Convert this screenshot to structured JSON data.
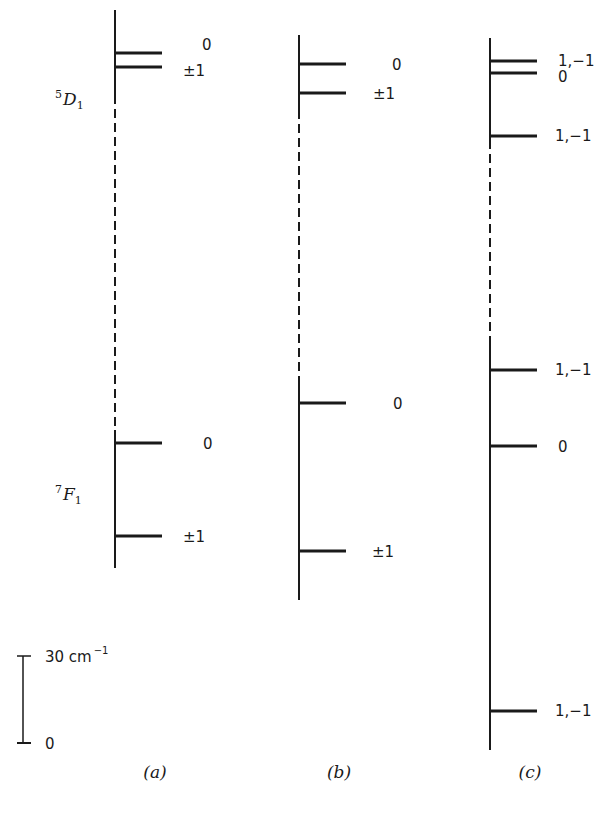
{
  "figure": {
    "type": "energy-level-diagram",
    "panels": [
      {
        "id": "a",
        "caption": "(a)",
        "axis_x": 115,
        "axis_top": 10,
        "axis_bottom": 568,
        "dashed_from": 95,
        "dashed_to": 430,
        "upper_term": {
          "symbol": "D",
          "left_sup": "5",
          "sub": "1",
          "label_x": 55,
          "label_y": 105
        },
        "lower_term": {
          "symbol": "F",
          "left_sup": "7",
          "sub": "1",
          "label_x": 55,
          "label_y": 500
        },
        "levels": [
          {
            "y": 53,
            "label": "0",
            "label_x": 202,
            "label_y": 50
          },
          {
            "y": 67,
            "label": "±1",
            "label_x": 183,
            "label_y": 76
          },
          {
            "y": 443,
            "label": "0",
            "label_x": 203,
            "label_y": 449
          },
          {
            "y": 536,
            "label": "±1",
            "label_x": 183,
            "label_y": 542
          }
        ]
      },
      {
        "id": "b",
        "caption": "(b)",
        "axis_x": 299,
        "axis_top": 35,
        "axis_bottom": 600,
        "dashed_from": 110,
        "dashed_to": 385,
        "levels": [
          {
            "y": 64,
            "label": "0",
            "label_x": 392,
            "label_y": 70
          },
          {
            "y": 93,
            "label": "±1",
            "label_x": 373,
            "label_y": 99
          },
          {
            "y": 403,
            "label": "0",
            "label_x": 393,
            "label_y": 409
          },
          {
            "y": 551,
            "label": "±1",
            "label_x": 372,
            "label_y": 557
          }
        ]
      },
      {
        "id": "c",
        "caption": "(c)",
        "axis_x": 490,
        "axis_top": 38,
        "axis_bottom": 750,
        "dashed_from": 140,
        "dashed_to": 345,
        "levels": [
          {
            "y": 61,
            "label": "1,−1",
            "label_x": 558,
            "label_y": 66
          },
          {
            "y": 73,
            "label": "0",
            "label_x": 558,
            "label_y": 82
          },
          {
            "y": 136,
            "label": "1,−1",
            "label_x": 555,
            "label_y": 141
          },
          {
            "y": 370,
            "label": "1,−1",
            "label_x": 555,
            "label_y": 375
          },
          {
            "y": 446,
            "label": "0",
            "label_x": 558,
            "label_y": 452
          },
          {
            "y": 711,
            "label": "1,−1",
            "label_x": 555,
            "label_y": 716
          }
        ]
      }
    ],
    "scale_bar": {
      "x": 23,
      "top": 656,
      "bottom": 743,
      "top_label": "30 cm",
      "top_label_sup": "−1",
      "bottom_label": "0",
      "value_cm": 30
    },
    "captions_y": 778,
    "level_line_length": 47,
    "colors": {
      "ink": "#1a1a1a",
      "background": "#ffffff"
    }
  },
  "chart_data": {
    "type": "energy-level-diagram",
    "title": "",
    "units": "cm^-1",
    "scale": "30 cm^-1 scale bar",
    "panels": [
      {
        "panel": "(a)",
        "upper_term": "5D1",
        "upper_levels": [
          {
            "mj": "0",
            "rel_cm": 5
          },
          {
            "mj": "±1",
            "rel_cm": 0
          }
        ],
        "lower_term": "7F1",
        "lower_levels": [
          {
            "mj": "0",
            "rel_cm": 32
          },
          {
            "mj": "±1",
            "rel_cm": 0
          }
        ]
      },
      {
        "panel": "(b)",
        "upper_levels": [
          {
            "mj": "0",
            "rel_cm": 10
          },
          {
            "mj": "±1",
            "rel_cm": 0
          }
        ],
        "lower_levels": [
          {
            "mj": "0",
            "rel_cm": 51
          },
          {
            "mj": "±1",
            "rel_cm": 0
          }
        ]
      },
      {
        "panel": "(c)",
        "upper_levels": [
          {
            "mj": "1,−1",
            "rel_cm": 26
          },
          {
            "mj": "0",
            "rel_cm": 22
          },
          {
            "mj": "1,−1",
            "rel_cm": 0
          }
        ],
        "lower_levels": [
          {
            "mj": "1,−1",
            "rel_cm": 118
          },
          {
            "mj": "0",
            "rel_cm": 91
          },
          {
            "mj": "1,−1",
            "rel_cm": 0
          }
        ]
      }
    ]
  }
}
